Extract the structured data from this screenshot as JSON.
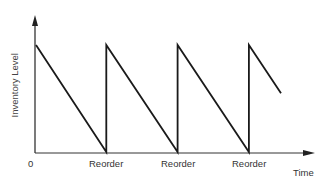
{
  "chart_data": {
    "type": "line",
    "title": "",
    "xlabel": "Time",
    "ylabel": "Inventory Level",
    "x_tick_labels": [
      "0",
      "Reorder",
      "Reorder",
      "Reorder"
    ],
    "grid": false,
    "legend": null,
    "series": [
      {
        "name": "Inventory Level",
        "x": [
          0,
          1,
          1,
          2,
          2,
          3,
          3,
          3.45
        ],
        "y": [
          1,
          0,
          1,
          0,
          1,
          0,
          1,
          0.55
        ]
      }
    ],
    "xlim": [
      0,
      3.9
    ],
    "ylim": [
      0,
      1.25
    ]
  },
  "labels": {
    "origin": "0",
    "reorder_1": "Reorder",
    "reorder_2": "Reorder",
    "reorder_3": "Reorder",
    "x_axis": "Time",
    "y_axis": "Inventory Level"
  }
}
